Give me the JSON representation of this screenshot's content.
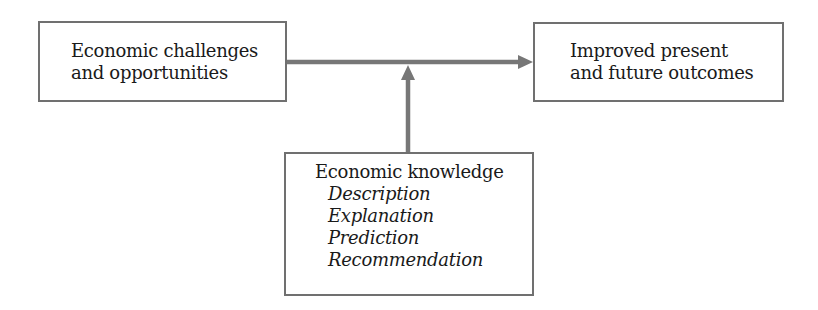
{
  "diagram": {
    "nodes": {
      "input": {
        "lines": [
          "Economic challenges",
          "and opportunities"
        ]
      },
      "output": {
        "lines": [
          "Improved present",
          "and future outcomes"
        ]
      },
      "knowledge": {
        "title": "Economic knowledge",
        "items": [
          "Description",
          "Explanation",
          "Prediction",
          "Recommendation"
        ]
      }
    },
    "edges": [
      {
        "from": "input",
        "to": "output",
        "type": "arrow"
      },
      {
        "from": "knowledge",
        "to": "input-output-edge",
        "type": "arrow"
      }
    ],
    "colors": {
      "border": "#707070",
      "arrow": "#777777",
      "text": "#1a1a1a",
      "background": "#ffffff"
    }
  }
}
